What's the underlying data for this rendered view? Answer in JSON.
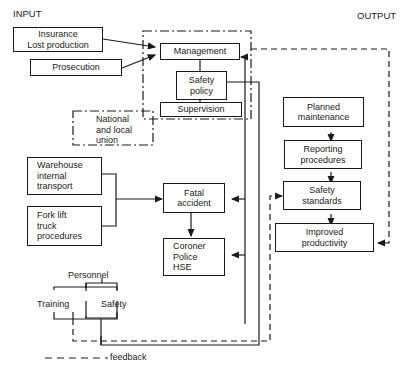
{
  "headers": {
    "input": "INPUT",
    "output": "OUTPUT"
  },
  "boxes": {
    "insurance": [
      "Insurance",
      "Lost production"
    ],
    "prosecution": [
      "Prosecution"
    ],
    "management": [
      "Management"
    ],
    "safety_policy": [
      "Safety",
      "policy"
    ],
    "supervision": [
      "Supervision"
    ],
    "union": [
      "National",
      "and local",
      "union"
    ],
    "warehouse": [
      "Warehouse",
      "internal",
      "transport"
    ],
    "forklift": [
      "Fork lift",
      "truck",
      "procedures"
    ],
    "fatal_accident": [
      "Fatal",
      "accident"
    ],
    "coroner": [
      "Coroner",
      "Police",
      "HSE"
    ],
    "planned_maintenance": [
      "Planned",
      "maintenance"
    ],
    "reporting_procedures": [
      "Reporting",
      "procedures"
    ],
    "safety_standards": [
      "Safety",
      "standards"
    ],
    "improved_productivity": [
      "Improved",
      "productivity"
    ]
  },
  "personnel": {
    "title": "Personnel",
    "left": "Training",
    "right": "Safety"
  },
  "legend": {
    "dashed_line": "feedback"
  },
  "line_color": "#1a1a1a"
}
